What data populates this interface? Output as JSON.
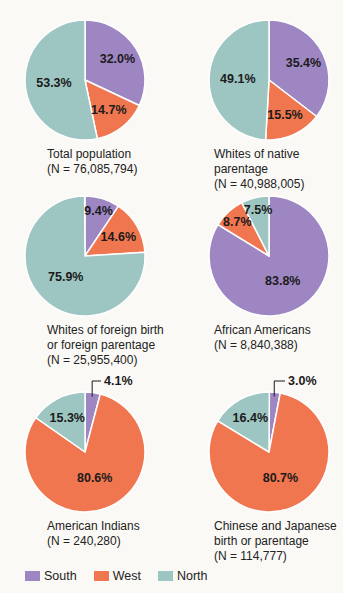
{
  "figure": {
    "background": "#fbf9f6",
    "description_regions": [
      "South",
      "West",
      "North"
    ]
  },
  "legend": {
    "items": [
      {
        "label": "South",
        "color": "#9e86c3"
      },
      {
        "label": "West",
        "color": "#f0764f"
      },
      {
        "label": "North",
        "color": "#9dc5c2"
      }
    ]
  },
  "chart_data": [
    {
      "type": "pie",
      "id": "total-population",
      "caption_lines": [
        "Total population",
        "(N = 76,085,794)"
      ],
      "n": 76085794,
      "start_angle_deg": 0,
      "direction": "clockwise",
      "slices": [
        {
          "region": "South",
          "value": 32.0,
          "label": "32.0%"
        },
        {
          "region": "West",
          "value": 14.7,
          "label": "14.7%"
        },
        {
          "region": "North",
          "value": 53.3,
          "label": "53.3%"
        }
      ]
    },
    {
      "type": "pie",
      "id": "whites-of-native-parentage",
      "caption_lines": [
        "Whites of native parentage",
        "(N = 40,988,005)"
      ],
      "n": 40988005,
      "start_angle_deg": 0,
      "direction": "clockwise",
      "slices": [
        {
          "region": "South",
          "value": 35.4,
          "label": "35.4%"
        },
        {
          "region": "West",
          "value": 15.5,
          "label": "15.5%"
        },
        {
          "region": "North",
          "value": 49.1,
          "label": "49.1%"
        }
      ]
    },
    {
      "type": "pie",
      "id": "whites-of-foreign-birth-or-parentage",
      "caption_lines": [
        "Whites of foreign birth",
        "or foreign parentage",
        "(N = 25,955,400)"
      ],
      "n": 25955400,
      "start_angle_deg": 0,
      "direction": "clockwise",
      "slices": [
        {
          "region": "South",
          "value": 9.4,
          "label": "9.4%"
        },
        {
          "region": "West",
          "value": 14.6,
          "label": "14.6%"
        },
        {
          "region": "North",
          "value": 75.9,
          "label": "75.9%"
        }
      ]
    },
    {
      "type": "pie",
      "id": "african-americans",
      "caption_lines": [
        "African Americans",
        "(N = 8,840,388)"
      ],
      "n": 8840388,
      "start_angle_deg": 0,
      "direction": "clockwise",
      "slices": [
        {
          "region": "South",
          "value": 83.8,
          "label": "83.8%"
        },
        {
          "region": "West",
          "value": 8.7,
          "label": "8.7%"
        },
        {
          "region": "North",
          "value": 7.5,
          "label": "7.5%"
        }
      ]
    },
    {
      "type": "pie",
      "id": "american-indians",
      "caption_lines": [
        "American Indians",
        "(N = 240,280)"
      ],
      "n": 240280,
      "start_angle_deg": 0,
      "direction": "clockwise",
      "slices": [
        {
          "region": "South",
          "value": 4.1,
          "label": "4.1%",
          "label_callout": true
        },
        {
          "region": "West",
          "value": 80.6,
          "label": "80.6%"
        },
        {
          "region": "North",
          "value": 15.3,
          "label": "15.3%"
        }
      ]
    },
    {
      "type": "pie",
      "id": "chinese-and-japanese",
      "caption_lines": [
        "Chinese and Japanese",
        "birth or parentage",
        "(N = 114,777)"
      ],
      "n": 114777,
      "start_angle_deg": 0,
      "direction": "clockwise",
      "slices": [
        {
          "region": "South",
          "value": 3.0,
          "label": "3.0%",
          "label_callout": true
        },
        {
          "region": "West",
          "value": 80.7,
          "label": "80.7%"
        },
        {
          "region": "North",
          "value": 16.4,
          "label": "16.4%"
        }
      ]
    }
  ]
}
